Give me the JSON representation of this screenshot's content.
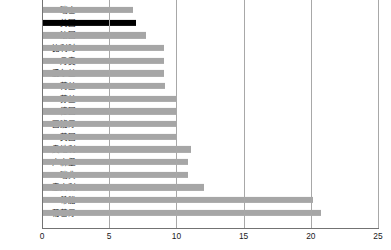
{
  "chart_data": {
    "type": "bar",
    "orientation": "horizontal",
    "title": "",
    "xlabel": "",
    "ylabel": "",
    "xlim": [
      0,
      25
    ],
    "xticks": [
      0,
      5,
      10,
      15,
      20,
      25
    ],
    "grid": true,
    "legend": "none",
    "highlight_color": "#000000",
    "bar_color": "#a6a6a6",
    "highlight_category": "美国",
    "categories": [
      "瑞士",
      "美国",
      "法国",
      "比利时",
      "丹麦",
      "爱尔兰",
      "荷兰",
      "芬兰",
      "德国",
      "西班牙",
      "英国",
      "奥地利",
      "卢森堡",
      "瑞典",
      "意大利",
      "希腊",
      "葡萄牙"
    ],
    "values": [
      6.7,
      6.9,
      7.7,
      9.0,
      9.0,
      9.0,
      9.1,
      9.9,
      9.9,
      9.9,
      9.9,
      11.0,
      10.8,
      10.8,
      12.0,
      20.1,
      20.7
    ]
  }
}
